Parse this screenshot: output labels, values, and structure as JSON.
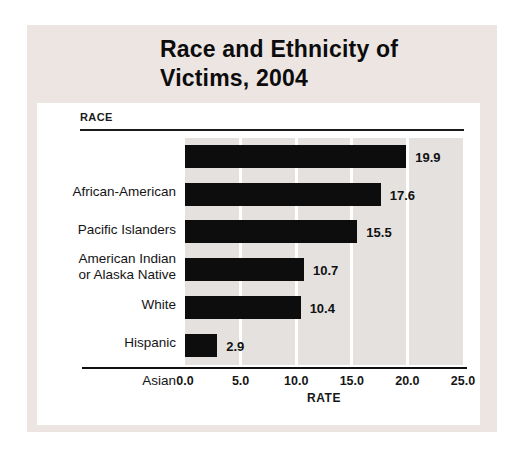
{
  "figure": {
    "title_line1": "Race and Ethnicity of",
    "title_line2": "Victims, 2004"
  },
  "colors": {
    "band_bg": "#ece5e2",
    "panel_bg": "#ffffff",
    "plot_bg": "#e4e1de",
    "bar": "#0d0d0d"
  },
  "chart_data": {
    "type": "bar",
    "orientation": "horizontal",
    "title": "Race and Ethnicity of Victims, 2004",
    "group_label": "RACE",
    "xlabel": "RATE",
    "categories": [
      "African-American",
      "Pacific Islanders",
      "American Indian or Alaska Native",
      "White",
      "Hispanic",
      "Asian"
    ],
    "category_display_lines": [
      [
        "African-American"
      ],
      [
        "Pacific Islanders"
      ],
      [
        "American Indian",
        "or Alaska Native"
      ],
      [
        "White"
      ],
      [
        "Hispanic"
      ],
      [
        "Asian"
      ]
    ],
    "values": [
      19.9,
      17.6,
      15.5,
      10.7,
      10.4,
      2.9
    ],
    "value_labels": [
      "19.9",
      "17.6",
      "15.5",
      "10.7",
      "10.4",
      "2.9"
    ],
    "xlim": [
      0,
      25
    ],
    "x_ticks": [
      0,
      5,
      10,
      15,
      20,
      25
    ],
    "x_tick_labels": [
      "0.0",
      "5.0",
      "10.0",
      "15.0",
      "20.0",
      "25.0"
    ],
    "gridlines": [
      5,
      10,
      15,
      20
    ],
    "grid": "vertical white lines on gray plot background",
    "legend": "none",
    "bar_color": "#0d0d0d"
  }
}
